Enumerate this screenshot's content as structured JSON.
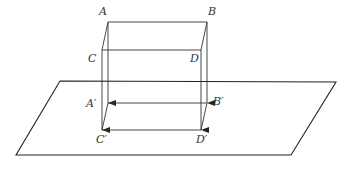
{
  "diagram": {
    "stroke_color": "#333333",
    "background": "#ffffff",
    "plane": {
      "points": [
        [
          60,
          81
        ],
        [
          336,
          82
        ],
        [
          291,
          155
        ],
        [
          16,
          155
        ]
      ]
    },
    "vertices": {
      "A": [
        108,
        22
      ],
      "B": [
        207,
        22
      ],
      "C": [
        102,
        50
      ],
      "D": [
        201,
        50
      ],
      "A'": [
        108,
        103
      ],
      "B'": [
        207,
        103
      ],
      "C'": [
        102,
        130
      ],
      "D'": [
        201,
        130
      ]
    },
    "labels": [
      {
        "id": "A",
        "text": "A",
        "x": 99,
        "y": 6
      },
      {
        "id": "B",
        "text": "B",
        "x": 208,
        "y": 6
      },
      {
        "id": "C",
        "text": "C",
        "x": 88,
        "y": 53
      },
      {
        "id": "D",
        "text": "D",
        "x": 190,
        "y": 53
      },
      {
        "id": "A-prime",
        "text": "A′",
        "x": 86,
        "y": 98
      },
      {
        "id": "B-prime",
        "text": "B′",
        "x": 213,
        "y": 96
      },
      {
        "id": "C-prime",
        "text": "C′",
        "x": 96,
        "y": 134
      },
      {
        "id": "D-prime",
        "text": "D′",
        "x": 196,
        "y": 134
      }
    ],
    "projection_arrows": [
      {
        "from": "A",
        "to": "A'"
      },
      {
        "from": "B",
        "to": "B'"
      },
      {
        "from": "C",
        "to": "C'"
      },
      {
        "from": "D",
        "to": "D'"
      }
    ]
  }
}
